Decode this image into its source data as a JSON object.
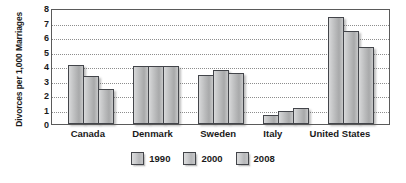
{
  "chart_data": {
    "type": "bar",
    "title": "",
    "xlabel": "",
    "ylabel": "Divorces per 1,000 Marriages",
    "ylim": [
      0,
      8
    ],
    "ytick_step": 1,
    "yticks": [
      "8",
      "7",
      "6",
      "5",
      "4",
      "3",
      "2",
      "1",
      "0"
    ],
    "grid": true,
    "legend_position": "bottom-center",
    "categories": [
      "Canada",
      "Denmark",
      "Sweden",
      "Italy",
      "United States"
    ],
    "series": [
      {
        "name": "1990",
        "values": [
          4.1,
          4.0,
          3.4,
          0.6,
          7.4
        ]
      },
      {
        "name": "2000",
        "values": [
          3.3,
          4.0,
          3.7,
          0.9,
          6.4
        ]
      },
      {
        "name": "2008",
        "values": [
          2.4,
          4.0,
          3.5,
          1.1,
          5.3
        ]
      }
    ],
    "colors": {
      "bar_fill_light": "#d9dadb",
      "bar_fill_dark": "#a8a9aa",
      "bar_border": "#43454a",
      "gridline": "#8d8d8d",
      "frame": "#5a5a5a",
      "text": "#1a1a1a",
      "background": "#ffffff"
    }
  }
}
